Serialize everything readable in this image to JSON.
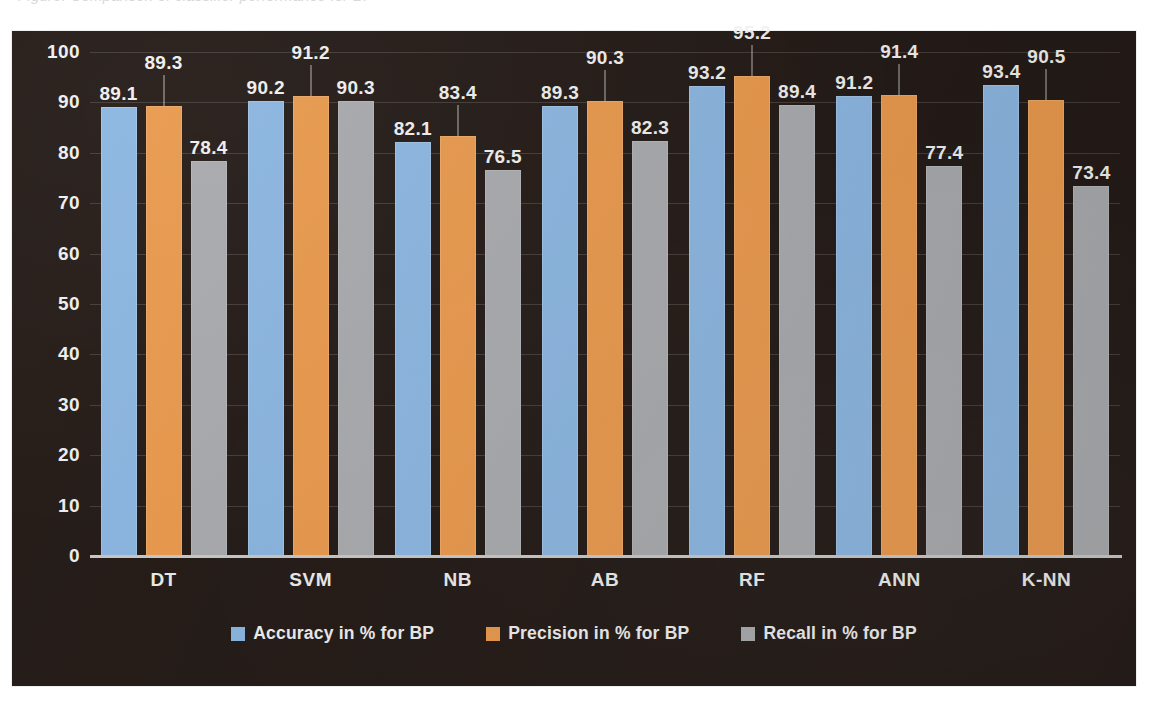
{
  "caption": {
    "text": "Figure: Comparison of classifier performance for BP"
  },
  "chart_data": {
    "type": "bar",
    "title": "",
    "xlabel": "",
    "ylabel": "",
    "categories": [
      "DT",
      "SVM",
      "NB",
      "AB",
      "RF",
      "ANN",
      "K-NN"
    ],
    "series": [
      {
        "name": "Accuracy in % for BP",
        "color": "#8cb7e2",
        "values": [
          89.1,
          90.2,
          82.1,
          89.3,
          93.2,
          91.2,
          93.4
        ]
      },
      {
        "name": "Precision in % for BP",
        "color": "#eb9a4d",
        "values": [
          89.3,
          91.2,
          83.4,
          90.3,
          95.2,
          91.4,
          90.5
        ]
      },
      {
        "name": "Recall in % for BP",
        "color": "#a9abae",
        "values": [
          78.4,
          90.3,
          76.5,
          82.3,
          89.4,
          77.4,
          73.4
        ]
      }
    ],
    "ylim": [
      0,
      100
    ],
    "yticks": [
      100,
      90,
      80,
      70,
      60,
      50,
      40,
      30,
      20,
      10,
      0
    ],
    "grid": true,
    "legend_position": "bottom",
    "data_labels": true,
    "plot_background": "#231a16"
  },
  "legend": {
    "items": [
      {
        "label": "Accuracy in % for BP",
        "color": "#8cb7e2"
      },
      {
        "label": "Precision in % for BP",
        "color": "#eb9a4d"
      },
      {
        "label": "Recall in % for BP",
        "color": "#a9abae"
      }
    ]
  }
}
